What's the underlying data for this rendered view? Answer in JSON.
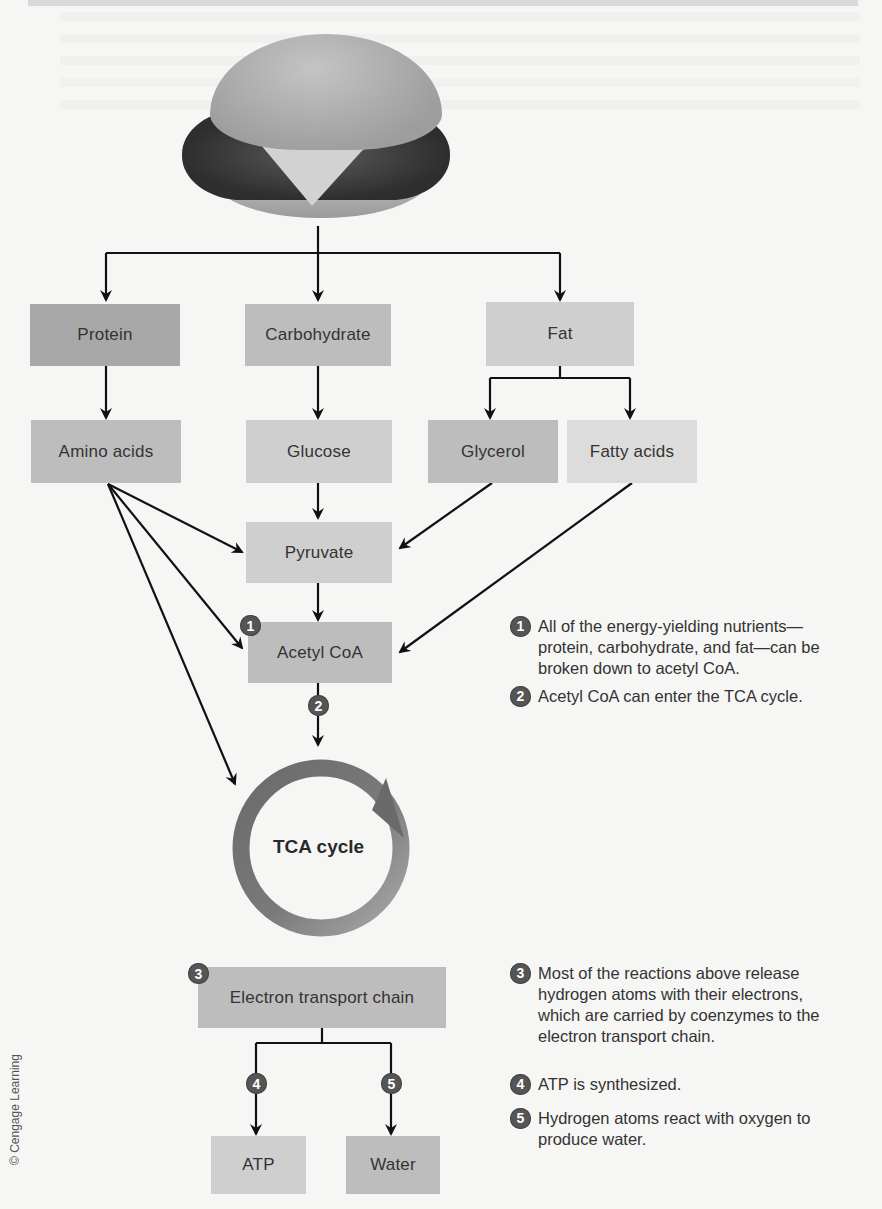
{
  "figure": {
    "type": "metabolic-pathway-diagram",
    "food_image": "cheeseburger",
    "credit": "© Cengage Learning"
  },
  "nutrients": [
    {
      "label": "Protein"
    },
    {
      "label": "Carbohydrate"
    },
    {
      "label": "Fat"
    }
  ],
  "breakdown_products": [
    {
      "label": "Amino acids"
    },
    {
      "label": "Glucose"
    },
    {
      "label": "Glycerol"
    },
    {
      "label": "Fatty acids"
    }
  ],
  "intermediates": {
    "pyruvate": "Pyruvate",
    "acetyl_coa": "Acetyl CoA",
    "tca_cycle": "TCA cycle",
    "etc": "Electron transport chain"
  },
  "end_products": [
    {
      "label": "ATP"
    },
    {
      "label": "Water"
    }
  ],
  "step_numbers": [
    "1",
    "2",
    "3",
    "4",
    "5"
  ],
  "notes": [
    {
      "num": "1",
      "text": "All of the energy-yielding nutrients—protein, carbohydrate, and fat—can be broken down to acetyl CoA."
    },
    {
      "num": "2",
      "text": "Acetyl CoA can enter the TCA cycle."
    },
    {
      "num": "3",
      "text": "Most of the reactions above release hydrogen atoms with their electrons, which are carried by coenzymes to the electron transport chain."
    },
    {
      "num": "4",
      "text": "ATP is synthesized."
    },
    {
      "num": "5",
      "text": "Hydrogen atoms react with oxygen to produce water."
    }
  ],
  "colors": {
    "protein_box": "#a8a8a8",
    "carbohydrate_box": "#bdbdbd",
    "fat_box": "#cfcfcf",
    "badge": "#555555",
    "tca_ring_dark": "#6e6e6e",
    "tca_ring_light": "#a0a0a0"
  }
}
